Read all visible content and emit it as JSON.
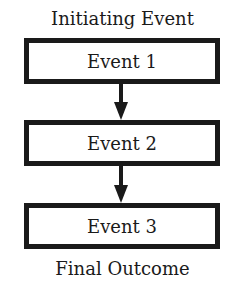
{
  "diagram": {
    "top_label": "Initiating Event",
    "bottom_label": "Final Outcome",
    "boxes": [
      {
        "label": "Event 1"
      },
      {
        "label": "Event 2"
      },
      {
        "label": "Event 3"
      }
    ],
    "colors": {
      "stroke": "#1a1a1a",
      "background": "#ffffff"
    }
  }
}
